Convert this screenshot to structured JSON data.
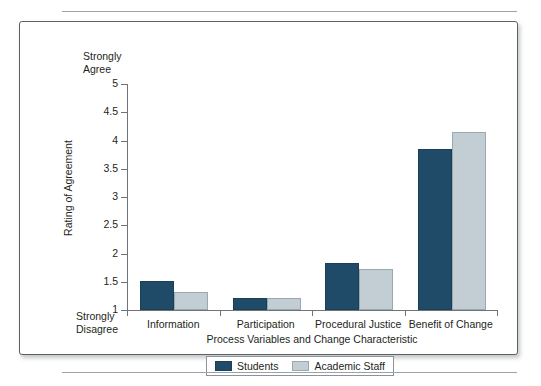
{
  "chart_data": {
    "type": "bar",
    "title": "",
    "xlabel": "Process Variables and Change Characteristic",
    "ylabel": "Rating of Agreement",
    "categories": [
      "Information",
      "Participation",
      "Procedural Justice",
      "Benefit of Change"
    ],
    "series": [
      {
        "name": "Students",
        "color": "#1F4B68",
        "values": [
          1.52,
          1.21,
          1.83,
          3.85
        ]
      },
      {
        "name": "Academic Staff",
        "color": "#C3CED4",
        "values": [
          1.32,
          1.21,
          1.73,
          4.15
        ]
      }
    ],
    "ylim": [
      1,
      5
    ],
    "yticks": [
      "1",
      "1.5",
      "2",
      "2.5",
      "3",
      "3.5",
      "4",
      "4.5",
      "5"
    ],
    "y_axis_top_anchor": "Strongly\nAgree",
    "y_axis_bottom_anchor": "Strongly\nDisagree",
    "grid": false,
    "legend_position": "bottom"
  },
  "legend": {
    "items": [
      {
        "label": "Students"
      },
      {
        "label": "Academic Staff"
      }
    ]
  }
}
